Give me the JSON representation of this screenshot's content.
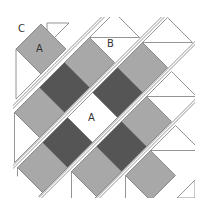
{
  "diagram": {
    "labels": {
      "corner_triangle": "C",
      "side_triangle": "B",
      "square_top": "A",
      "square_center": "A"
    },
    "colors": {
      "background": "#ffffff",
      "light": "#a8a8a8",
      "dark": "#555555",
      "white": "#ffffff",
      "outline": "#7a7a7a",
      "gap_line": "#7a7a7a"
    },
    "square_half_diagonal": 25,
    "strips": [
      {
        "row": 1,
        "sum": 90,
        "pieces": [
          {
            "type": "triangle-C",
            "t": 20
          },
          {
            "type": "square",
            "fill": "light",
            "t": -8,
            "label": "A"
          },
          {
            "type": "side-triangle-left",
            "t": -58
          }
        ]
      },
      {
        "row": 2,
        "sum": 152,
        "pieces": [
          {
            "type": "side-triangle-top",
            "t": 77,
            "label": "B"
          },
          {
            "type": "square",
            "fill": "light",
            "t": 27
          },
          {
            "type": "square",
            "fill": "dark",
            "t": -23
          },
          {
            "type": "square",
            "fill": "light",
            "t": -73
          },
          {
            "type": "side-triangle-left",
            "t": -123
          }
        ]
      },
      {
        "row": 3,
        "sum": 210,
        "pieces": [
          {
            "type": "side-triangle-top",
            "t": 125
          },
          {
            "type": "square",
            "fill": "light",
            "t": 75
          },
          {
            "type": "square",
            "fill": "dark",
            "t": 25
          },
          {
            "type": "square",
            "fill": "white",
            "t": -25,
            "label": "A"
          },
          {
            "type": "square",
            "fill": "dark",
            "t": -75
          },
          {
            "type": "square",
            "fill": "light",
            "t": -125
          },
          {
            "type": "side-triangle-left",
            "t": -175
          }
        ]
      },
      {
        "row": 4,
        "sum": 268,
        "pieces": [
          {
            "type": "side-triangle-top",
            "t": 75
          },
          {
            "type": "square",
            "fill": "light",
            "t": 25
          },
          {
            "type": "square",
            "fill": "dark",
            "t": -25
          },
          {
            "type": "square",
            "fill": "light",
            "t": -75
          },
          {
            "type": "side-triangle-left",
            "t": -125
          }
        ]
      },
      {
        "row": 5,
        "sum": 326,
        "pieces": [
          {
            "type": "side-triangle-top",
            "t": 25
          },
          {
            "type": "square",
            "fill": "light",
            "t": -25
          },
          {
            "type": "side-triangle-left",
            "t": -75
          }
        ]
      }
    ],
    "corner_bottom_right": {
      "type": "triangle-C"
    }
  }
}
